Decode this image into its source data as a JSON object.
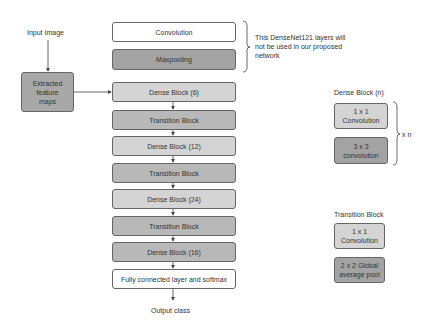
{
  "input": {
    "label": "Input Image"
  },
  "extracted": {
    "label": "Extracted feature maps"
  },
  "main_column": [
    {
      "label": "Convolution",
      "style": "white"
    },
    {
      "label": "Maxpooling",
      "style": "dark"
    },
    {
      "label": "Dense Block (6)",
      "style": "light"
    },
    {
      "label": "Transition Block",
      "style": "mid"
    },
    {
      "label": "Dense Block (12)",
      "style": "light"
    },
    {
      "label": "Transition Block",
      "style": "mid"
    },
    {
      "label": "Dense Block (24)",
      "style": "light"
    },
    {
      "label": "Transition Block",
      "style": "mid"
    },
    {
      "label": "Dense Block (16)",
      "style": "mid"
    },
    {
      "label": "Fully connected layer and softmax",
      "style": "white"
    }
  ],
  "output": {
    "label": "Output class"
  },
  "annotation": {
    "text": "This DenseNet121 layers will not be used in our proposed network"
  },
  "dense_block_legend": {
    "title": "Dense Block (n)",
    "items": [
      "1 x 1 Convolution",
      "3 x 3 convolution"
    ],
    "repeat": "x n"
  },
  "transition_block_legend": {
    "title": "Transition Block",
    "items": [
      "1 x 1 Convolution",
      "2 x 2 Global average pool"
    ]
  },
  "colors": {
    "white": "#ffffff",
    "light": "#d4d4d4",
    "mid": "#b8b8b8",
    "dark": "#a3a3a3",
    "border": "#666666"
  }
}
